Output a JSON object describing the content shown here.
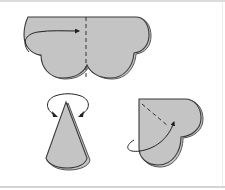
{
  "figure": {
    "colors": {
      "paper_fill": "#c4c4c4",
      "outline": "#3a3a3a",
      "back_layer_outline": "#555555",
      "background": "#ffffff",
      "frame_rule": "#d8d8d8"
    },
    "steps": [
      {
        "id": "step-1",
        "shape": "scalloped-cloud",
        "action": "fold left half over to the right along dashed vertical line",
        "icons": [
          "fold-arrow-icon",
          "dashed-fold-line"
        ]
      },
      {
        "id": "step-2",
        "shape": "cone",
        "action": "turn over",
        "icons": [
          "turn-over-arrow-icon"
        ]
      },
      {
        "id": "step-3",
        "shape": "heart",
        "action": "fold along dashed diagonal line",
        "icons": [
          "fold-arrow-icon",
          "dashed-fold-line"
        ]
      }
    ]
  }
}
